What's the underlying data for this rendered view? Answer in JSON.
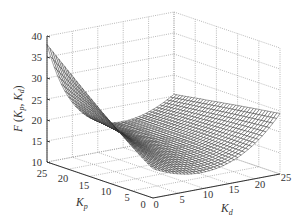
{
  "chart_data": {
    "type": "surface3d",
    "title": "",
    "xlabel": "K_d",
    "ylabel": "K_p",
    "zlabel": "F(K_p, K_d)",
    "xaxis": {
      "label": "K_d",
      "range": [
        0,
        25
      ],
      "ticks": [
        0,
        5,
        10,
        15,
        20,
        25
      ]
    },
    "yaxis": {
      "label": "K_p",
      "range": [
        0,
        25
      ],
      "ticks": [
        0,
        5,
        10,
        15,
        20,
        25
      ]
    },
    "zaxis": {
      "label": "F(K_p, K_d)",
      "range": [
        10,
        40
      ],
      "ticks": [
        10,
        15,
        20,
        25,
        30,
        35,
        40
      ]
    },
    "grid": true,
    "style": "wireframe mesh, black lines, white fill",
    "surface_samples": [
      {
        "Kp": 25,
        "Kd": 0,
        "F": 38
      },
      {
        "Kp": 20,
        "Kd": 0,
        "F": 35
      },
      {
        "Kp": 15,
        "Kd": 0,
        "F": 31
      },
      {
        "Kp": 10,
        "Kd": 0,
        "F": 26
      },
      {
        "Kp": 5,
        "Kd": 0,
        "F": 20
      },
      {
        "Kp": 0,
        "Kd": 0,
        "F": 17
      },
      {
        "Kp": 25,
        "Kd": 5,
        "F": 33
      },
      {
        "Kp": 15,
        "Kd": 10,
        "F": 18
      },
      {
        "Kp": 5,
        "Kd": 10,
        "F": 12
      },
      {
        "Kp": 0,
        "Kd": 15,
        "F": 12
      },
      {
        "Kp": 0,
        "Kd": 25,
        "F": 24
      },
      {
        "Kp": 10,
        "Kd": 25,
        "F": 26
      },
      {
        "Kp": 25,
        "Kd": 25,
        "F": 22
      }
    ]
  },
  "labels": {
    "z_main": "F",
    "z_args_open": "(K",
    "z_sub_p": "p",
    "z_comma": ", K",
    "z_sub_d": "d",
    "z_close": ")",
    "kp_main": "K",
    "kp_sub": "p",
    "kd_main": "K",
    "kd_sub": "d"
  },
  "ticks": {
    "z": [
      "40",
      "35",
      "30",
      "25",
      "20",
      "15",
      "10"
    ],
    "kp": [
      "25",
      "20",
      "15",
      "10",
      "5",
      "0"
    ],
    "kd": [
      "0",
      "5",
      "10",
      "15",
      "20",
      "25"
    ]
  }
}
